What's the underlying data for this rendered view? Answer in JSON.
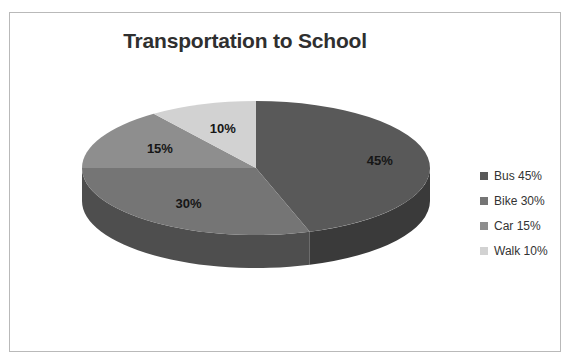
{
  "chart_data": {
    "type": "pie",
    "title": "Transportation to School",
    "categories": [
      "Bus",
      "Bike",
      "Car",
      "Walk"
    ],
    "values": [
      45,
      30,
      15,
      10
    ],
    "value_labels": [
      "45%",
      "30%",
      "15%",
      "10%"
    ],
    "legend_labels": [
      "Bus 45%",
      "Bike 30%",
      "Car 15%",
      "Walk 10%"
    ],
    "legend_position": "right",
    "colors": [
      "#595959",
      "#757575",
      "#8e8e8e",
      "#d2d2d2"
    ],
    "side_colors": [
      "#3a3a3a",
      "#4e4e4e",
      "#636363",
      "#9b9b9b"
    ],
    "three_d": true,
    "grid": false,
    "xlabel": "",
    "ylabel": ""
  },
  "frame": {
    "border_color": "#b9b9b9"
  },
  "title_color": "#2f2f2f"
}
